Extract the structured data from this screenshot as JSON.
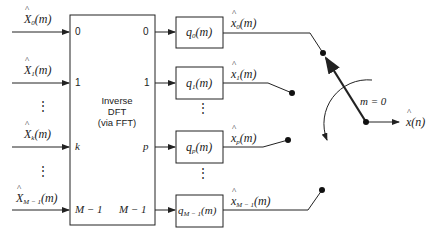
{
  "diagram": {
    "dft_block": {
      "title_line1": "Inverse",
      "title_line2": "DFT",
      "title_line3": "(via FFT)",
      "input_ports": [
        "0",
        "1",
        "k",
        "M − 1"
      ],
      "output_ports": [
        "0",
        "1",
        "p",
        "M − 1"
      ]
    },
    "inputs": [
      {
        "symbol": "X",
        "sub": "0",
        "arg": "(m)"
      },
      {
        "symbol": "X",
        "sub": "1",
        "arg": "(m)"
      },
      {
        "symbol": "X",
        "sub": "k",
        "arg": "(m)"
      },
      {
        "symbol": "X",
        "sub": "M − 1",
        "arg": "(m)"
      }
    ],
    "filters": [
      {
        "symbol": "q",
        "sub": "0",
        "arg": "(m)"
      },
      {
        "symbol": "q",
        "sub": "1",
        "arg": "(m)"
      },
      {
        "symbol": "q",
        "sub": "p",
        "arg": "(m)"
      },
      {
        "symbol": "q",
        "sub": "M − 1",
        "arg": "(m)"
      }
    ],
    "filter_outputs": [
      {
        "symbol": "x",
        "sub": "0",
        "arg": "(m)"
      },
      {
        "symbol": "x",
        "sub": "1",
        "arg": "(m)"
      },
      {
        "symbol": "x",
        "sub": "p",
        "arg": "(m)"
      },
      {
        "symbol": "x",
        "sub": "M − 1",
        "arg": "(m)"
      }
    ],
    "commutator_label": "m = 0",
    "output": {
      "symbol": "x",
      "arg": "(n)"
    },
    "ellipsis": "⋮"
  }
}
